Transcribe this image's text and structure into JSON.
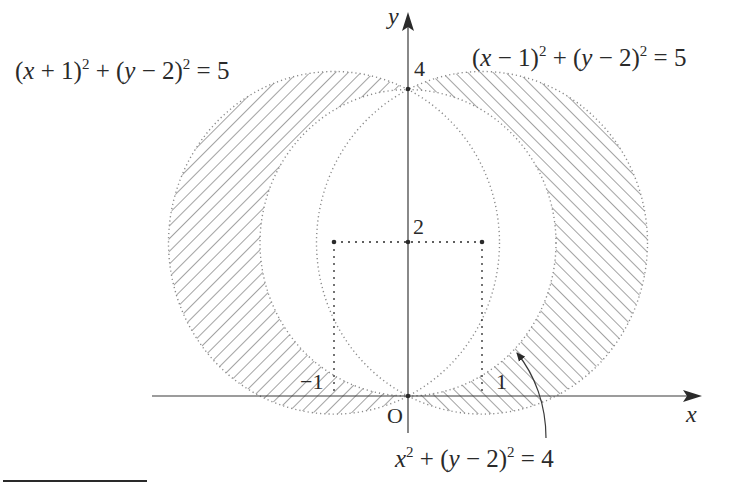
{
  "diagram": {
    "type": "coordinate-geometry",
    "axes": {
      "x_label": "x",
      "y_label": "y",
      "origin_label": "O",
      "ticks": {
        "y_4": "4",
        "y_2": "2",
        "x_neg1": "−1",
        "x_1": "1"
      }
    },
    "curves": [
      {
        "id": "left-circle",
        "equation_parts": [
          "(",
          "x",
          " + 1)",
          "2",
          " + (",
          "y",
          " − 2)",
          "2",
          " = 5"
        ],
        "center": [
          -1,
          2
        ],
        "radius_sq": 5,
        "style": "dotted",
        "hatch": "forward-slash"
      },
      {
        "id": "right-circle",
        "equation_parts": [
          "(",
          "x",
          " − 1)",
          "2",
          " + (",
          "y",
          " − 2)",
          "2",
          " = 5"
        ],
        "center": [
          1,
          2
        ],
        "radius_sq": 5,
        "style": "dotted",
        "hatch": "back-slash"
      },
      {
        "id": "middle-circle",
        "equation_parts": [
          "",
          "x",
          "",
          "2",
          " + (",
          "y",
          " − 2)",
          "2",
          " = 4"
        ],
        "center": [
          0,
          2
        ],
        "radius_sq": 4,
        "style": "dotted",
        "hatch": "none"
      }
    ],
    "guide_points": [
      [
        -1,
        2
      ],
      [
        0,
        2
      ],
      [
        1,
        2
      ],
      [
        0,
        4
      ],
      [
        0,
        0
      ]
    ],
    "colors": {
      "ink": "#2a2a2a",
      "hatch": "#6e6e6e",
      "dotted": "#8a8a8a",
      "background": "#ffffff"
    }
  }
}
